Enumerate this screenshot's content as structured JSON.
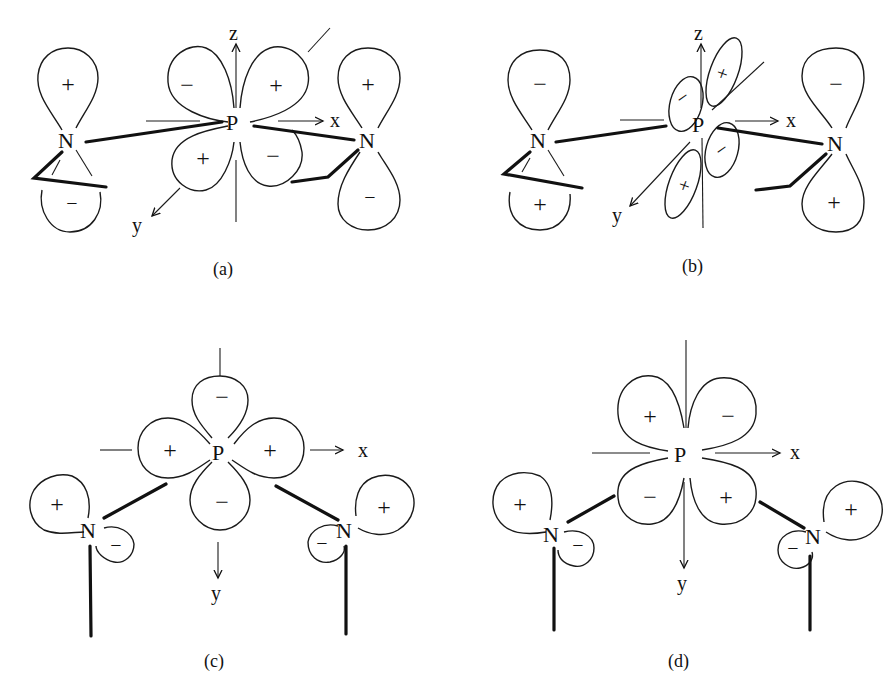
{
  "figure": {
    "panels": [
      {
        "id": "a",
        "caption": "(a)",
        "center_atom": "P",
        "ligand_atoms": [
          "N",
          "N"
        ],
        "axes": {
          "x": "x",
          "y": "y",
          "z": "z"
        },
        "p_lobe_signs": {
          "upper_left": "−",
          "upper_right": "+",
          "lower_left": "+",
          "lower_right": "−"
        },
        "n_left_signs": {
          "top": "+",
          "bottom": "−"
        },
        "n_right_signs": {
          "top": "+",
          "bottom": "−"
        }
      },
      {
        "id": "b",
        "caption": "(b)",
        "center_atom": "P",
        "ligand_atoms": [
          "N",
          "N"
        ],
        "axes": {
          "x": "x",
          "y": "y",
          "z": "z"
        },
        "p_lobe_signs": {
          "upper": "+",
          "left": "−",
          "right": "−",
          "lower": "+"
        },
        "n_left_signs": {
          "top": "−",
          "bottom": "+"
        },
        "n_right_signs": {
          "top": "−",
          "bottom": "+"
        }
      },
      {
        "id": "c",
        "caption": "(c)",
        "center_atom": "P",
        "ligand_atoms": [
          "N",
          "N"
        ],
        "axes": {
          "x": "x",
          "y": "y"
        },
        "p_lobe_signs": {
          "top": "−",
          "left": "+",
          "right": "+",
          "bottom": "−"
        },
        "n_left_signs": {
          "big": "+",
          "small": "−"
        },
        "n_right_signs": {
          "big": "+",
          "small": "−"
        }
      },
      {
        "id": "d",
        "caption": "(d)",
        "center_atom": "P",
        "ligand_atoms": [
          "N",
          "N"
        ],
        "axes": {
          "x": "x",
          "y": "y"
        },
        "p_lobe_signs": {
          "upper_left": "+",
          "upper_right": "−",
          "lower_left": "−",
          "lower_right": "+"
        },
        "n_left_signs": {
          "big": "+",
          "small": "−"
        },
        "n_right_signs": {
          "big": "+",
          "small": "−"
        }
      }
    ]
  }
}
